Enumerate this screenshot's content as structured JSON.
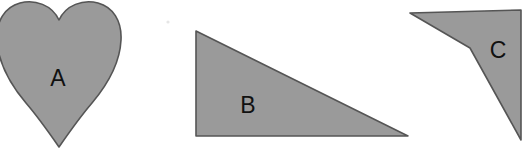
{
  "figure": {
    "background_color": "#ffffff",
    "width": 530,
    "height": 153
  },
  "style": {
    "fill_color": "#9a9a9a",
    "outline_color": "#555555",
    "label_color": "#111111",
    "speck_color": "#e6e6e6"
  },
  "shapes": [
    {
      "id": "shape-a",
      "label": "A",
      "kind": "heart",
      "fill": "#9a9a9a",
      "label_x": 58,
      "label_y": 78,
      "path": "M 59 20 C 52 5 35 -1 20 3 C 5 7 -4 21 -3 40 C -2 62 10 84 26 103 C 38 117 50 134 59 147 C 68 134 80 117 92 103 C 108 84 120 62 121 40 C 122 21 113 7 98 3 C 83 -1 66 5 59 20 Z"
    },
    {
      "id": "shape-b",
      "label": "B",
      "kind": "right-triangle",
      "fill": "#9a9a9a",
      "label_x": 248,
      "label_y": 105,
      "path": "M 196 31 L 408 136 L 196 136 Z"
    },
    {
      "id": "shape-c",
      "label": "C",
      "kind": "concave-quadrilateral",
      "fill": "#9a9a9a",
      "label_x": 498,
      "label_y": 50,
      "path": "M 410 13 L 521 10 L 521 140 L 470 48 Z"
    }
  ],
  "artifacts": [
    {
      "id": "speck-1",
      "name": "dust-speck",
      "x": 168,
      "y": 22,
      "r": 1.6
    }
  ]
}
